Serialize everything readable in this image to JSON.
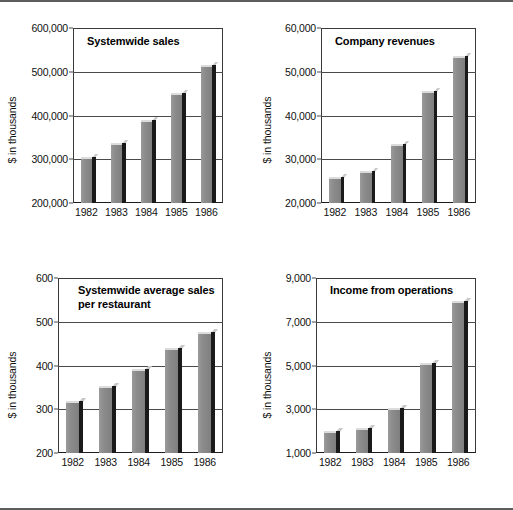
{
  "page": {
    "background": "#ffffff",
    "border_color": "#5d5d5d",
    "bar_face_color": "#8c8c8c",
    "bar_side_color": "#1a1a1a",
    "axis_color": "#3a3a3a"
  },
  "chart_data": [
    {
      "id": "systemwide-sales",
      "type": "bar",
      "title": "Systemwide sales",
      "xlabel": "",
      "ylabel": "$ in thousands",
      "categories": [
        "1982",
        "1983",
        "1984",
        "1985",
        "1986"
      ],
      "values": [
        305000,
        338000,
        389000,
        452000,
        515000
      ],
      "ylim": [
        200000,
        600000
      ],
      "yticks": [
        200000,
        300000,
        400000,
        500000,
        600000
      ],
      "ytick_labels": [
        "200,000",
        "300,000",
        "400,000",
        "500,000",
        "600,000"
      ],
      "grid": true,
      "legend": "none"
    },
    {
      "id": "company-revenues",
      "type": "bar",
      "title": "Company revenues",
      "xlabel": "",
      "ylabel": "$ in thousands",
      "categories": [
        "1982",
        "1983",
        "1984",
        "1985",
        "1986"
      ],
      "values": [
        26000,
        27400,
        33600,
        45700,
        53500
      ],
      "ylim": [
        20000,
        60000
      ],
      "yticks": [
        20000,
        30000,
        40000,
        50000,
        60000
      ],
      "ytick_labels": [
        "20,000",
        "30,000",
        "40,000",
        "50,000",
        "60,000"
      ],
      "grid": true,
      "legend": "none"
    },
    {
      "id": "systemwide-average-sales-per-restaurant",
      "type": "bar",
      "title": "Systemwide average sales\nper restaurant",
      "xlabel": "",
      "ylabel": "$ in thousands",
      "categories": [
        "1982",
        "1983",
        "1984",
        "1985",
        "1986"
      ],
      "values": [
        319,
        353,
        392,
        441,
        477
      ],
      "ylim": [
        200,
        600
      ],
      "yticks": [
        200,
        300,
        400,
        500,
        600
      ],
      "ytick_labels": [
        "200",
        "300",
        "400",
        "500",
        "600"
      ],
      "grid": true,
      "legend": "none"
    },
    {
      "id": "income-from-operations",
      "type": "bar",
      "title": "Income from operations",
      "xlabel": "",
      "ylabel": "$ in thousands",
      "categories": [
        "1982",
        "1983",
        "1984",
        "1985",
        "1986"
      ],
      "values": [
        2000,
        2150,
        3050,
        5100,
        7950
      ],
      "ylim": [
        1000,
        9000
      ],
      "yticks": [
        1000,
        3000,
        5000,
        7000,
        9000
      ],
      "ytick_labels": [
        "1,000",
        "3,000",
        "5,000",
        "7,000",
        "9,000"
      ],
      "grid": true,
      "legend": "none"
    }
  ]
}
